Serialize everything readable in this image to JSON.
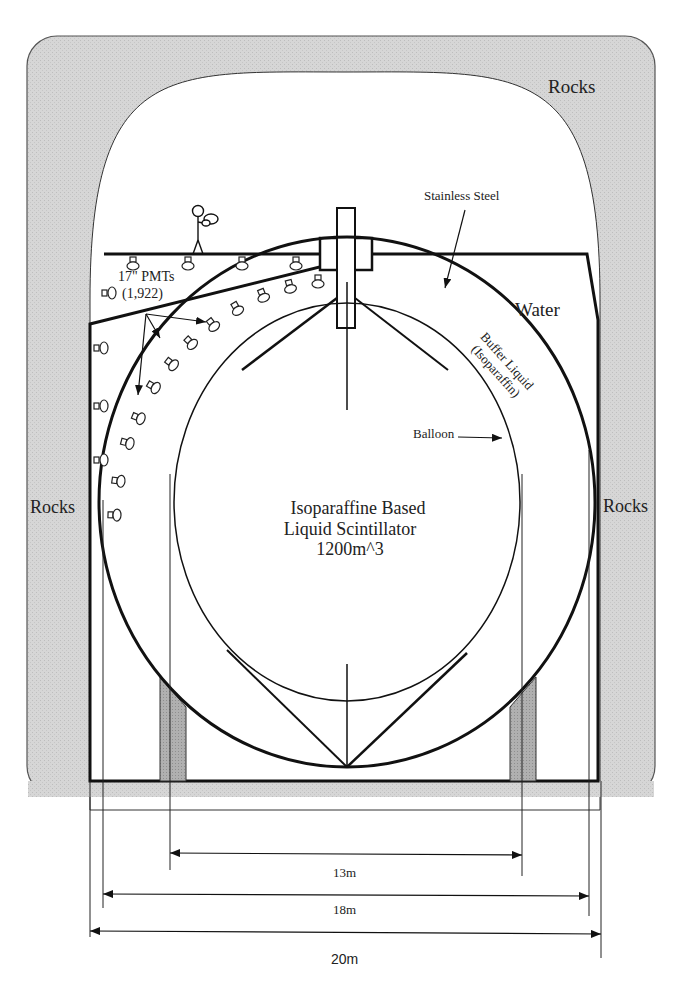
{
  "diagram": {
    "type": "cross-section schematic",
    "colors": {
      "rock_fill": "#d9d9d9",
      "support_fill": "#a8a8a8",
      "line": "#111111",
      "background": "#ffffff"
    },
    "labels": {
      "rocks_top_right": "Rocks",
      "rocks_left": "Rocks",
      "rocks_right": "Rocks",
      "stainless_steel": "Stainless Steel",
      "water": "Water",
      "pmts_line1": "17\" PMTs",
      "pmts_line2": "(1,922)",
      "buffer_line1": "Buffer Liquid",
      "buffer_line2": "(Isoparaffin)",
      "balloon": "Balloon",
      "scintillator_line1": "Isoparaffine Based",
      "scintillator_line2": "Liquid Scintillator",
      "scintillator_line3": "1200m^3"
    },
    "dimensions": [
      {
        "label": "13m",
        "x1": 170,
        "x2": 522,
        "y": 853
      },
      {
        "label": "18m",
        "x1": 103,
        "x2": 589,
        "y": 895
      },
      {
        "label": "20m",
        "x1": 90,
        "x2": 601,
        "y": 933
      }
    ]
  }
}
